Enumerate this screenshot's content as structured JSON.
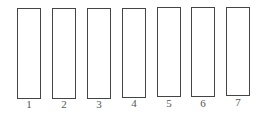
{
  "diagram": {
    "type": "numbered-rectangles",
    "items": [
      {
        "label": "1"
      },
      {
        "label": "2"
      },
      {
        "label": "3"
      },
      {
        "label": "4"
      },
      {
        "label": "5"
      },
      {
        "label": "6"
      },
      {
        "label": "7"
      }
    ],
    "stroke_color": "#444444",
    "label_color": "#555555"
  }
}
